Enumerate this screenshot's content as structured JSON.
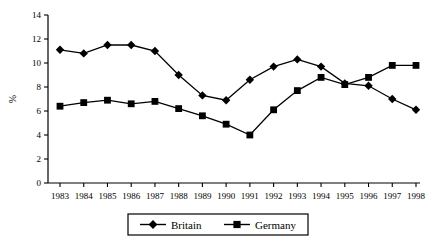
{
  "chart_data": {
    "type": "line",
    "title": "",
    "xlabel": "",
    "ylabel": "%",
    "categories": [
      "1983",
      "1984",
      "1985",
      "1986",
      "1987",
      "1988",
      "1989",
      "1990",
      "1991",
      "1992",
      "1993",
      "1994",
      "1995",
      "1996",
      "1997",
      "1998"
    ],
    "ylim": [
      0,
      14
    ],
    "yticks": [
      0,
      2,
      4,
      6,
      8,
      10,
      12,
      14
    ],
    "grid": false,
    "legend_position": "bottom",
    "series": [
      {
        "name": "Britain",
        "marker": "diamond",
        "color": "#000000",
        "values": [
          11.1,
          10.8,
          11.5,
          11.5,
          11.0,
          9.0,
          7.3,
          6.9,
          8.6,
          9.7,
          10.3,
          9.7,
          8.3,
          8.1,
          7.0,
          6.1
        ]
      },
      {
        "name": "Germany",
        "marker": "square",
        "color": "#000000",
        "values": [
          6.4,
          6.7,
          6.9,
          6.6,
          6.8,
          6.2,
          5.6,
          4.9,
          4.0,
          6.1,
          7.7,
          8.8,
          8.2,
          8.8,
          9.8,
          9.8
        ]
      }
    ]
  },
  "legend": {
    "items": [
      {
        "label": "Britain",
        "marker": "diamond"
      },
      {
        "label": "Germany",
        "marker": "square"
      }
    ]
  }
}
